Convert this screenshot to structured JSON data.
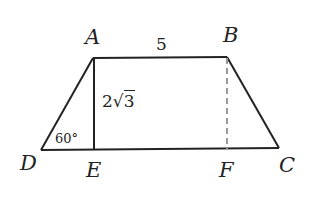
{
  "diagram": {
    "type": "trapezoid",
    "points": {
      "A": {
        "label": "A",
        "x": 93,
        "y": 58
      },
      "B": {
        "label": "B",
        "x": 227,
        "y": 57
      },
      "C": {
        "label": "C",
        "x": 279,
        "y": 148
      },
      "D": {
        "label": "D",
        "x": 41,
        "y": 150
      },
      "E": {
        "label": "E",
        "x": 94,
        "y": 150
      },
      "F": {
        "label": "F",
        "x": 227,
        "y": 149
      }
    },
    "annotations": {
      "ab_length": "5",
      "height": "2√3",
      "height_coef": "2",
      "height_radicand": "3",
      "angle_d": "60°"
    },
    "colors": {
      "stroke": "#222222",
      "dashed": "#999999"
    }
  }
}
